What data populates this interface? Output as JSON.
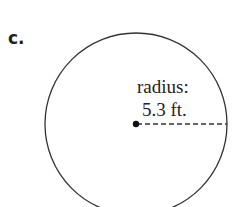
{
  "part_label": "c.",
  "diagram": {
    "shape": "circle",
    "radius_label_line1": "radius:",
    "radius_label_line2": "5.3 ft.",
    "radius_value": 5.3,
    "radius_unit": "ft."
  }
}
